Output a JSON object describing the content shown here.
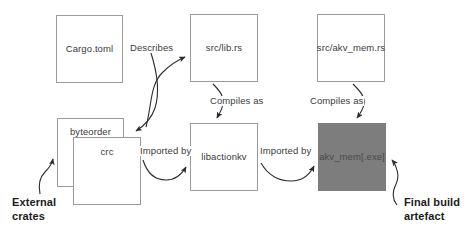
{
  "diagram": {
    "background_color": "#ffffff",
    "box_border_color": "#9a9a9a",
    "shaded_box_color": "#7d7d7d",
    "text_color": "#3b3b3b",
    "callout_color": "#1b1b1b",
    "nodes": [
      {
        "id": "cargo-toml",
        "label": "Cargo.toml",
        "shaded": false
      },
      {
        "id": "src-lib-rs",
        "label": "src/lib.rs",
        "shaded": false
      },
      {
        "id": "src-akv-mem",
        "label": "src/akv_mem.rs",
        "shaded": false
      },
      {
        "id": "byteorder",
        "label": "byteorder",
        "shaded": false
      },
      {
        "id": "crc",
        "label": "crc",
        "shaded": false
      },
      {
        "id": "libactionkv",
        "label": "libactionkv",
        "shaded": false
      },
      {
        "id": "akv-mem-exe",
        "label": "akv_mem[.exe]",
        "shaded": true
      }
    ],
    "edges": [
      {
        "id": "describes",
        "label": "Describes",
        "from": "cargo-toml",
        "to": "src-lib-rs"
      },
      {
        "id": "describes-crates",
        "label": "",
        "from": "cargo-toml",
        "to": "byteorder"
      },
      {
        "id": "compiles-as-lib",
        "label": "Compiles as",
        "from": "src-lib-rs",
        "to": "libactionkv"
      },
      {
        "id": "compiles-as-bin",
        "label": "Compiles as",
        "from": "src-akv-mem",
        "to": "akv-mem-exe"
      },
      {
        "id": "imported-by-crates",
        "label": "Imported by",
        "from": "crc",
        "to": "libactionkv"
      },
      {
        "id": "imported-by-lib",
        "label": "Imported by",
        "from": "libactionkv",
        "to": "akv-mem-exe"
      }
    ],
    "callouts": [
      {
        "id": "external-crates",
        "line1": "External",
        "line2": "crates",
        "points_to": "byteorder"
      },
      {
        "id": "final-build-artefact",
        "line1": "Final build",
        "line2": "artefact",
        "points_to": "akv-mem-exe"
      }
    ]
  }
}
